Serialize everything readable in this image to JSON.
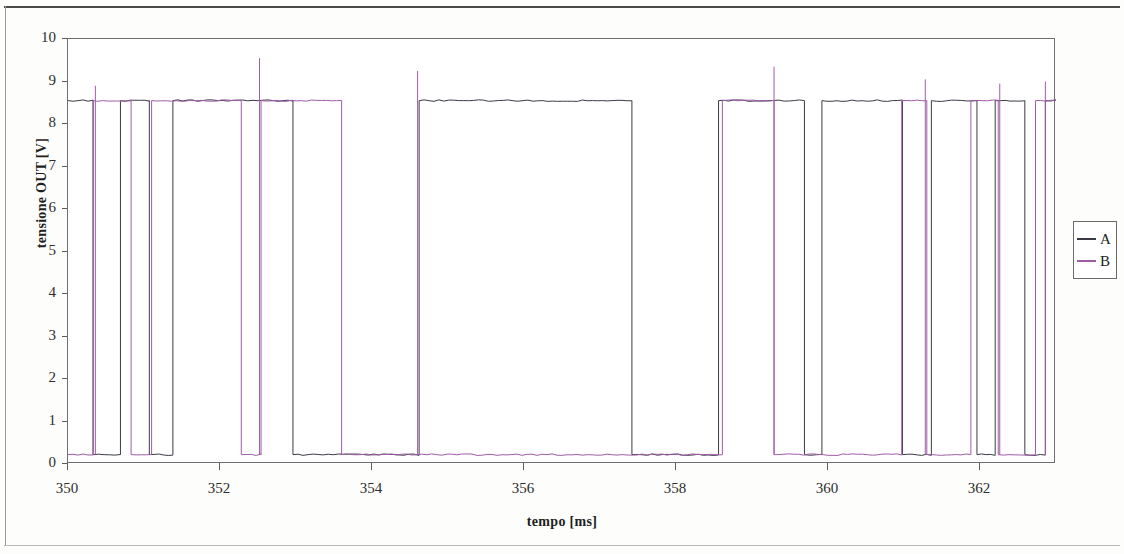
{
  "chart_data": {
    "type": "line",
    "title": "",
    "xlabel": "tempo [ms]",
    "ylabel": "tensione OUT [V]",
    "xlim": [
      350,
      363
    ],
    "ylim": [
      0,
      10
    ],
    "xticks": [
      350,
      352,
      354,
      356,
      358,
      360,
      362
    ],
    "yticks": [
      0,
      1,
      2,
      3,
      4,
      5,
      6,
      7,
      8,
      9,
      10
    ],
    "xtick_labels": [
      "350",
      "352",
      "354",
      "356",
      "358",
      "360",
      "362"
    ],
    "ytick_labels": [
      "0",
      "1",
      "2",
      "3",
      "4",
      "5",
      "6",
      "7",
      "8",
      "9",
      "10"
    ],
    "grid": false,
    "legend_position": "right",
    "logic_high_v": 8.55,
    "logic_low_v": 0.22,
    "series": [
      {
        "name": "A",
        "color": "#3a3a45",
        "waveform": "digital",
        "edges": [
          [
            350.0,
            8.55
          ],
          [
            350.33,
            8.55
          ],
          [
            350.33,
            0.22
          ],
          [
            350.69,
            0.22
          ],
          [
            350.69,
            8.55
          ],
          [
            351.07,
            8.55
          ],
          [
            351.07,
            0.22
          ],
          [
            351.38,
            0.22
          ],
          [
            351.38,
            8.55
          ],
          [
            352.96,
            8.55
          ],
          [
            352.96,
            0.22
          ],
          [
            354.62,
            0.22
          ],
          [
            354.62,
            8.55
          ],
          [
            357.42,
            8.55
          ],
          [
            357.42,
            0.22
          ],
          [
            358.56,
            0.22
          ],
          [
            358.56,
            8.55
          ],
          [
            359.69,
            8.55
          ],
          [
            359.69,
            0.22
          ],
          [
            359.92,
            0.22
          ],
          [
            359.92,
            8.55
          ],
          [
            360.98,
            8.55
          ],
          [
            360.98,
            0.22
          ],
          [
            361.36,
            0.22
          ],
          [
            361.36,
            8.55
          ],
          [
            361.96,
            8.55
          ],
          [
            361.96,
            0.22
          ],
          [
            362.2,
            0.22
          ],
          [
            362.2,
            8.55
          ],
          [
            362.59,
            8.55
          ],
          [
            362.59,
            0.22
          ],
          [
            362.86,
            0.22
          ],
          [
            362.86,
            8.55
          ],
          [
            363.0,
            8.55
          ]
        ]
      },
      {
        "name": "B",
        "color": "#a05ba8",
        "waveform": "digital",
        "edges": [
          [
            350.0,
            0.22
          ],
          [
            350.33,
            0.22
          ],
          [
            350.33,
            8.55
          ],
          [
            350.83,
            8.55
          ],
          [
            350.83,
            0.22
          ],
          [
            351.1,
            0.22
          ],
          [
            351.1,
            8.55
          ],
          [
            352.28,
            8.55
          ],
          [
            352.28,
            0.22
          ],
          [
            352.54,
            0.22
          ],
          [
            352.54,
            8.55
          ],
          [
            353.6,
            8.55
          ],
          [
            353.6,
            0.22
          ],
          [
            358.61,
            0.22
          ],
          [
            358.61,
            8.55
          ],
          [
            359.29,
            8.55
          ],
          [
            359.29,
            0.22
          ],
          [
            360.97,
            0.22
          ],
          [
            360.97,
            8.55
          ],
          [
            361.3,
            8.55
          ],
          [
            361.3,
            0.22
          ],
          [
            361.88,
            0.22
          ],
          [
            361.88,
            8.55
          ],
          [
            362.24,
            8.55
          ],
          [
            362.24,
            0.22
          ],
          [
            362.73,
            0.22
          ],
          [
            362.73,
            8.55
          ],
          [
            363.0,
            8.55
          ]
        ],
        "spikes": [
          [
            350.36,
            8.9
          ],
          [
            352.52,
            9.55
          ],
          [
            354.6,
            9.25
          ],
          [
            359.29,
            9.35
          ],
          [
            361.28,
            9.05
          ],
          [
            362.26,
            8.95
          ],
          [
            362.86,
            9.0
          ]
        ]
      }
    ]
  },
  "axes": {
    "y_label": "tensione OUT [V]",
    "x_label": "tempo [ms]"
  },
  "legend": {
    "entries": [
      {
        "label": "A",
        "color": "#3a3a45"
      },
      {
        "label": "B",
        "color": "#a05ba8"
      }
    ]
  }
}
